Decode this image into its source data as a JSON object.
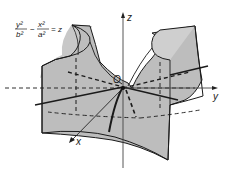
{
  "figure": {
    "equation": {
      "numerator_left": "y²",
      "denominator_left": "b²",
      "minus": "−",
      "numerator_right": "x²",
      "denominator_right": "a²",
      "equals": "= z"
    },
    "axes": {
      "x_label": "x",
      "y_label": "y",
      "z_label": "z",
      "origin_label": "O"
    },
    "colors": {
      "surface_fill": "#bdbdbd",
      "surface_light": "#d4d4d4",
      "stroke": "#1a1a1a",
      "axis": "#333333",
      "background": "#ffffff"
    }
  }
}
